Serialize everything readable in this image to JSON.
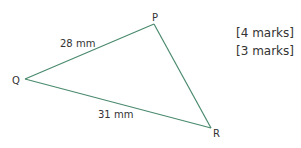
{
  "triangle": {
    "stroke_color": "#4a8a6e",
    "vertices": [
      {
        "label": "P"
      },
      {
        "label": "Q"
      },
      {
        "label": "R"
      }
    ],
    "sides": [
      {
        "from": "Q",
        "to": "P",
        "length_label": "28 mm"
      },
      {
        "from": "Q",
        "to": "R",
        "length_label": "31 mm"
      },
      {
        "from": "P",
        "to": "R",
        "length_label": ""
      }
    ]
  },
  "marks": [
    {
      "label": "[4 marks]"
    },
    {
      "label": "[3 marks]"
    }
  ]
}
